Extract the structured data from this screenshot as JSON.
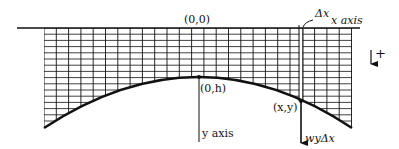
{
  "diagram": {
    "labels": {
      "origin": "(0,0)",
      "x_axis": "x axis",
      "y_axis": "y axis",
      "vertex": "(0,h)",
      "point": "(x,y)",
      "delta_x": "Δx",
      "force": "wyΔx",
      "direction_plus": "+"
    },
    "geometry": {
      "x_axis_line": {
        "x1": 17,
        "x2": 360,
        "y": 28
      },
      "grid": {
        "left": 44,
        "right": 352,
        "top": 28,
        "v_step": 12.3,
        "h_step": 6.2
      },
      "curve": {
        "left": [
          44,
          128
        ],
        "vertex": [
          199,
          77
        ],
        "right": [
          352,
          128
        ]
      },
      "strip": {
        "x1": 299,
        "x2": 303
      },
      "point": [
        301,
        101
      ],
      "force_arrow_end_y": 143,
      "y_axis_line": {
        "x": 199,
        "y1": 28,
        "y2": 142
      }
    },
    "colors": {
      "ink": "#111111",
      "background": "#ffffff"
    }
  }
}
